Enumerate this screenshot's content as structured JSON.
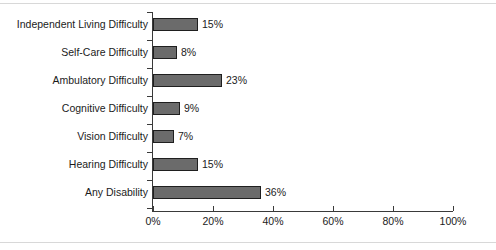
{
  "chart_data": {
    "type": "bar",
    "orientation": "horizontal",
    "title": "",
    "subtitle": "",
    "xlabel": "",
    "ylabel": "",
    "xlim": [
      0,
      100
    ],
    "grid": false,
    "legend": null,
    "xticks": [
      "0%",
      "20%",
      "40%",
      "60%",
      "80%",
      "100%"
    ],
    "xtick_values": [
      0,
      20,
      40,
      60,
      80,
      100
    ],
    "categories": [
      "Independent Living Difficulty",
      "Self-Care Difficulty",
      "Ambulatory Difficulty",
      "Cognitive Difficulty",
      "Vision Difficulty",
      "Hearing Difficulty",
      "Any Disability"
    ],
    "values": [
      15,
      8,
      23,
      9,
      7,
      15,
      36
    ],
    "data_labels": [
      "15%",
      "8%",
      "23%",
      "9%",
      "7%",
      "15%",
      "36%"
    ],
    "colors": {
      "bar_fill": "#6b6b6b",
      "bar_border": "#1f1f1f",
      "axis": "#3a3a3a",
      "text": "#1b1b1b",
      "background": "#ffffff",
      "frame_rule": "#d8d8d8"
    }
  }
}
